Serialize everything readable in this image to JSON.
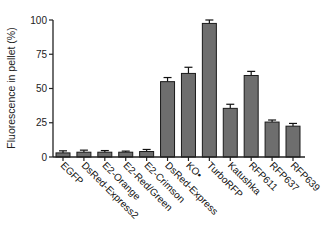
{
  "chart_data": {
    "type": "bar",
    "title": "",
    "xlabel": "",
    "ylabel": "Fluorescence in pellet (%)",
    "ylim": [
      0,
      100
    ],
    "yticks": [
      0,
      25,
      50,
      75,
      100
    ],
    "grid": false,
    "legend": null,
    "categories": [
      "EGFP",
      "DsRed-Express2",
      "E2-Orange",
      "E2-Red/Green",
      "E2-Crimson",
      "DsRed-Express",
      "KO•",
      "TurboRFP",
      "Katushka",
      "RFP611",
      "RFP637",
      "RFP639"
    ],
    "values": [
      3,
      3.5,
      3.5,
      3.5,
      4,
      55,
      61,
      97.5,
      35.5,
      59.5,
      25.5,
      22.5
    ],
    "errors": [
      1.5,
      1.5,
      1.2,
      0.8,
      1.5,
      3,
      4.5,
      2.5,
      3,
      3,
      1.5,
      2
    ],
    "colors": {
      "bar": "#6e6e6e",
      "bar_edge": "#1a1a1a",
      "axis": "#222222"
    }
  }
}
